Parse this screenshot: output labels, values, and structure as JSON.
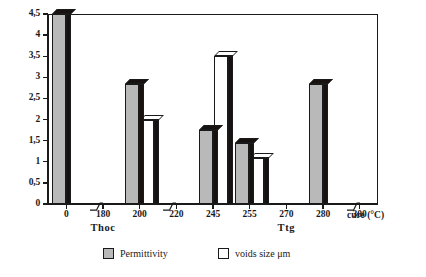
{
  "chart_data": {
    "type": "bar",
    "title": "",
    "subtitle": "",
    "xlabel": "cure (°C)",
    "ylabel": "",
    "ylim": [
      0,
      4.5
    ],
    "ytick_step": 0.5,
    "grid": false,
    "decimal_separator": ",",
    "legend_position": "bottom",
    "categories": [
      "0",
      "180",
      "200",
      "220",
      "245",
      "255",
      "270",
      "280",
      "300"
    ],
    "ytick_labels": [
      "0",
      "0,5",
      "1",
      "1,5",
      "2",
      "2,5",
      "3",
      "3,5",
      "4",
      "4,5"
    ],
    "ytick_values": [
      0,
      0.5,
      1,
      1.5,
      2,
      2.5,
      3,
      3.5,
      4,
      4.5
    ],
    "series": [
      {
        "name": "Permittivity",
        "color": "#b9b9b9",
        "values": [
          4.5,
          0,
          2.85,
          0,
          1.75,
          1.45,
          0,
          2.85,
          0
        ]
      },
      {
        "name": "voids size μm",
        "color": "#ffffff",
        "values": [
          0,
          0,
          2.0,
          0,
          3.5,
          1.1,
          0,
          0,
          0
        ]
      }
    ],
    "group_annotations": [
      {
        "label": "Thoc",
        "category": "180"
      },
      {
        "label": "Ttg",
        "category": "270"
      }
    ],
    "axis_breaks": [
      "180",
      "220",
      "300"
    ]
  },
  "legend": {
    "items": [
      {
        "label": "Permittivity",
        "swatch": "gray"
      },
      {
        "label": "voids size μm",
        "swatch": "white"
      }
    ]
  }
}
